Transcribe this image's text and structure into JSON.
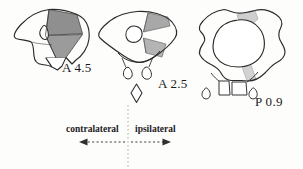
{
  "figure": {
    "type": "anatomical-section-diagram",
    "background_color": "#fdfdfc",
    "outline_color": "#2b2b2b",
    "sections": [
      {
        "id": "section-anterior-4-5",
        "label": "A 4.5",
        "label_position": {
          "x": 62,
          "y": 60
        },
        "shading": [
          {
            "region": "dorsolateral-wedge",
            "color": "#8f8f8f",
            "tone": "dark"
          },
          {
            "region": "ventrolateral-wedge",
            "color": "#9b9b9b",
            "tone": "dark"
          }
        ]
      },
      {
        "id": "section-anterior-2-5",
        "label": "A 2.5",
        "label_position": {
          "x": 158,
          "y": 76
        },
        "shading": [
          {
            "region": "dorsolateral-wedge",
            "color": "#a8a8a8",
            "tone": "medium"
          },
          {
            "region": "ventrolateral-wedge",
            "color": "#b4b4b4",
            "tone": "medium"
          }
        ]
      },
      {
        "id": "section-posterior-0-9",
        "label": "P 0.9",
        "label_position": {
          "x": 255,
          "y": 94
        },
        "shading": [
          {
            "region": "dorsolateral-wedge",
            "color": "#cfcfcf",
            "tone": "light"
          },
          {
            "region": "ventrolateral-wedge",
            "color": "#d2d2d2",
            "tone": "light"
          }
        ]
      }
    ]
  },
  "axis": {
    "midline_color": "#cdc6b8",
    "arrow_color": "#3a3a3a",
    "left_label": "contralateral",
    "right_label": "ipsilateral",
    "left_arrow_direction": "left",
    "right_arrow_direction": "right"
  }
}
